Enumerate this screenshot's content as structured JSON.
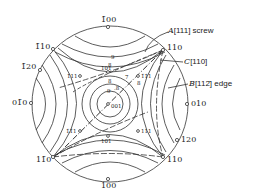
{
  "diagram": {
    "type": "stereographic-projection",
    "poles": {
      "top": "1̄00",
      "upper_left_1": "1̄10",
      "upper_left_2": "1̄20",
      "left": "01̄0",
      "lower_left": "11̄0",
      "bottom": "100",
      "upper_right": "110",
      "right": "010",
      "lower_right_1": "120",
      "lower_right_2": "110",
      "center": "001",
      "inner_upper": "101",
      "inner_lower": "101",
      "inner_upper_left": "1̄11",
      "inner_lower_left": "1̄1̄1",
      "inner_upper_right": "1̄1̄1",
      "inner_lower_right": "111"
    },
    "contour_values": {
      "upper_9": "9",
      "upper_8": "8",
      "upper_7": "7",
      "mid_8a": ".8",
      "mid_8b": "8",
      "mid_9": "9",
      "right_8": "8"
    },
    "annotations": {
      "a_label": "A",
      "a_text": "[111] screw",
      "c_label": "C",
      "c_text": "[110]",
      "b_label": "B",
      "b_text": "[112̄] edge"
    }
  }
}
